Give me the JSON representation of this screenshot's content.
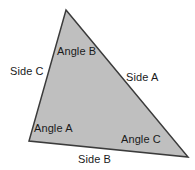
{
  "diagram": {
    "type": "labeled-triangle",
    "background_color": "#ffffff",
    "shape": {
      "name": "triangle",
      "fill_color": "#bfbfbf",
      "stroke_color": "#3b3b3b",
      "stroke_width": 1.5,
      "vertices": [
        {
          "name": "apex",
          "x": 66,
          "y": 10
        },
        {
          "name": "bottom-right",
          "x": 188,
          "y": 157
        },
        {
          "name": "bottom-left",
          "x": 29,
          "y": 141
        }
      ],
      "points_attr": "66,10 188,157 29,141"
    },
    "text_color": "#1a1a1a",
    "labels": {
      "angle_b": "Angle B",
      "side_c": "Side C",
      "side_a": "Side A",
      "angle_a": "Angle A",
      "angle_c": "Angle C",
      "side_b": "Side B"
    }
  }
}
